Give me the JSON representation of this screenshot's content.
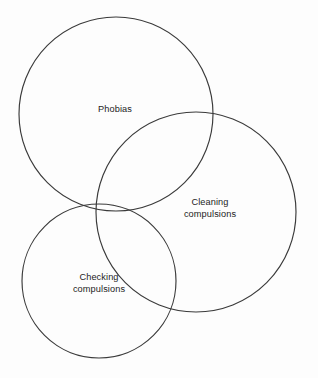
{
  "diagram": {
    "type": "venn",
    "title": "",
    "background_color": "#fdfdfd",
    "stroke_color": "#3a3a3a",
    "text_color": "#1c1c1c",
    "sets": [
      {
        "id": "phobias",
        "label": "Phobias",
        "label_lines": [
          "Phobias"
        ],
        "cx": 116,
        "cy": 114,
        "r": 97,
        "label_x": 115,
        "label_y": 110
      },
      {
        "id": "cleaning-compulsions",
        "label": "Cleaning compulsions",
        "label_lines": [
          "Cleaning",
          "compulsions"
        ],
        "cx": 196,
        "cy": 212,
        "r": 100,
        "label_x": 210,
        "label_y": 208
      },
      {
        "id": "checking-compulsions",
        "label": "Checking compulsions",
        "label_lines": [
          "Checking",
          "compulsions"
        ],
        "cx": 99,
        "cy": 281,
        "r": 77,
        "label_x": 99,
        "label_y": 283
      }
    ]
  }
}
